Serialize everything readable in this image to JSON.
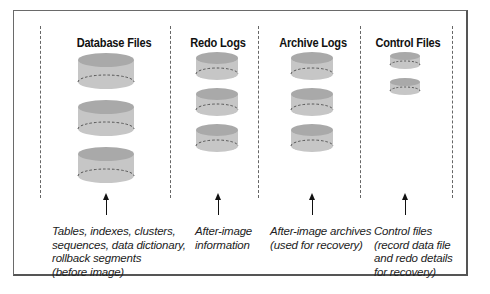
{
  "diagram": {
    "columns": [
      {
        "title": "Database Files",
        "cylinder_count": 3,
        "caption": "Tables, indexes, clusters,\nsequences, data dictionary,\nrollback segments\n(before image)"
      },
      {
        "title": "Redo Logs",
        "cylinder_count": 3,
        "caption": "After-image\ninformation"
      },
      {
        "title": "Archive Logs",
        "cylinder_count": 3,
        "caption": "After-image archives\n(used for recovery)"
      },
      {
        "title": "Control Files",
        "cylinder_count": 2,
        "caption": "Control files\n(record data file\nand redo details\nfor recovery)"
      }
    ],
    "colors": {
      "cylinder_body": "#c6c6c6",
      "cylinder_top": "#a9a9a9",
      "divider": "#666666",
      "frame": "#555555"
    }
  }
}
